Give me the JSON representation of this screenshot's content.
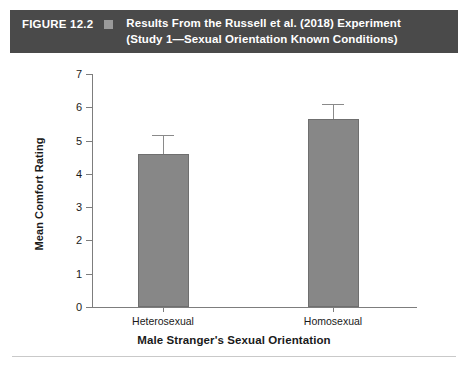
{
  "header": {
    "figure_number": "FIGURE 12.2",
    "marker_icon": "square-marker-icon",
    "title_line_1": "Results From the Russell et al. (2018) Experiment",
    "title_line_2": "(Study 1—Sexual Orientation Known Conditions)",
    "background_color": "#4a4a4a",
    "text_color": "#ffffff",
    "marker_color": "#9a9a9a"
  },
  "chart_data": {
    "type": "bar",
    "title": "Results From the Russell et al. (2018) Experiment (Study 1—Sexual Orientation Known Conditions)",
    "categories": [
      "Heterosexual",
      "Homosexual"
    ],
    "values": [
      4.6,
      5.65
    ],
    "errors": [
      0.58,
      0.46
    ],
    "xlabel": "Male Stranger's Sexual Orientation",
    "ylabel": "Mean Comfort Rating",
    "ylim": [
      0,
      7
    ],
    "yticks": [
      0,
      1,
      2,
      3,
      4,
      5,
      6,
      7
    ],
    "ytick_labels": [
      "0",
      "1",
      "2",
      "3",
      "4",
      "5",
      "6",
      "7"
    ],
    "grid": false,
    "legend": false,
    "bar_color": "#878787",
    "error_bar_color": "#8a8a8a",
    "axis_color": "#7d7d7d"
  }
}
